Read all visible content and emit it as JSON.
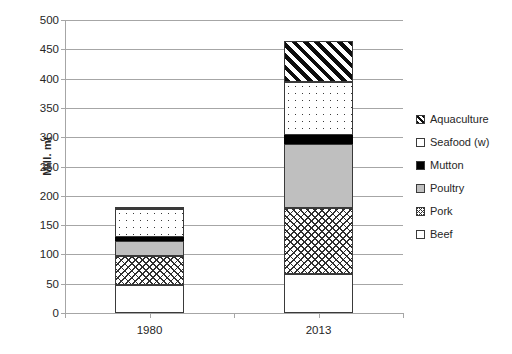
{
  "chart_data": {
    "type": "bar",
    "subtype": "stacked-bar",
    "title": "",
    "xlabel": "",
    "ylabel": "Mill. mt",
    "categories": [
      "1980",
      "2013"
    ],
    "ylim": [
      0,
      500
    ],
    "ytick_step": 50,
    "yticks": [
      0,
      50,
      100,
      150,
      200,
      250,
      300,
      350,
      400,
      450,
      500
    ],
    "ytick_labels": [
      "0",
      "50",
      "100",
      "150",
      "200",
      "250",
      "300",
      "350",
      "400",
      "450",
      "500"
    ],
    "grid": true,
    "grid_axis": "y",
    "legend_position": "right",
    "stack_order_bottom_to_top": [
      "Beef",
      "Pork",
      "Poultry",
      "Mutton",
      "Seafood (w)",
      "Aquaculture"
    ],
    "series": [
      {
        "name": "Beef",
        "pattern": "solid-white",
        "values": [
          47,
          66
        ]
      },
      {
        "name": "Pork",
        "pattern": "crosshatch",
        "values": [
          51,
          113
        ]
      },
      {
        "name": "Poultry",
        "pattern": "solid-gray",
        "values": [
          25,
          110
        ]
      },
      {
        "name": "Mutton",
        "pattern": "solid-black",
        "values": [
          6,
          14
        ]
      },
      {
        "name": "Seafood (w)",
        "pattern": "dotted",
        "values": [
          48,
          92
        ]
      },
      {
        "name": "Aquaculture",
        "pattern": "diagonal-hatch",
        "values": [
          4,
          69
        ]
      }
    ],
    "totals": [
      181,
      464
    ],
    "cumulative": {
      "1980": {
        "Beef": 47,
        "Pork": 98,
        "Poultry": 123,
        "Mutton": 129,
        "Seafood (w)": 177,
        "Aquaculture": 181
      },
      "2013": {
        "Beef": 66,
        "Pork": 179,
        "Poultry": 289,
        "Mutton": 303,
        "Seafood (w)": 395,
        "Aquaculture": 464
      }
    },
    "colors": {
      "Beef": "#ffffff",
      "Pork": "#ffffff",
      "Poultry": "#bfbfbf",
      "Mutton": "#000000",
      "Seafood (w)": "#ffffff",
      "Aquaculture": "#ffffff",
      "outline": "#3a3a3a",
      "gridline": "#a6a6a6",
      "text": "#262626"
    }
  },
  "legend": {
    "entries": [
      {
        "label": "Aquaculture",
        "pattern": "diagonal-hatch"
      },
      {
        "label": "Seafood (w)",
        "pattern": "dotted"
      },
      {
        "label": "Mutton",
        "pattern": "solid-black"
      },
      {
        "label": "Poultry",
        "pattern": "solid-gray"
      },
      {
        "label": "Pork",
        "pattern": "crosshatch"
      },
      {
        "label": "Beef",
        "pattern": "solid-white"
      }
    ]
  }
}
